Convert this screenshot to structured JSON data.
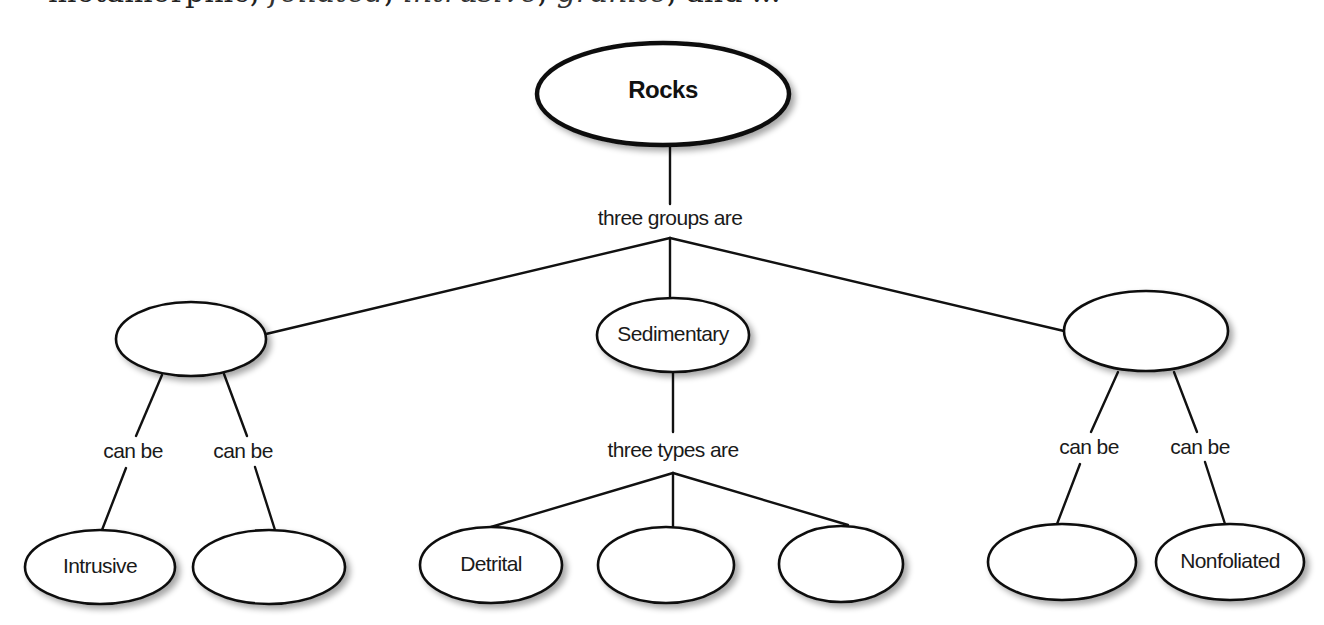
{
  "header": {
    "partial_text_start": "metamorphic, ",
    "partial_text_italic_1": "foliated",
    "partial_text_mid": ", ",
    "partial_text_italic_2": "intrusive",
    "partial_text_mid2": ", ",
    "partial_text_italic_3": "granite",
    "partial_text_end": ", and ..."
  },
  "diagram": {
    "root": {
      "label": "Rocks"
    },
    "root_link": "three groups are",
    "groups": [
      {
        "label": "",
        "links": [
          "can be",
          "can be"
        ],
        "children": [
          {
            "label": "Intrusive"
          },
          {
            "label": ""
          }
        ]
      },
      {
        "label": "Sedimentary",
        "link": "three types are",
        "children": [
          {
            "label": "Detrital"
          },
          {
            "label": ""
          },
          {
            "label": ""
          }
        ]
      },
      {
        "label": "",
        "links": [
          "can be",
          "can be"
        ],
        "children": [
          {
            "label": ""
          },
          {
            "label": "Nonfoliated"
          }
        ]
      }
    ]
  },
  "colors": {
    "stroke": "#111111",
    "background": "#ffffff",
    "text": "#1a1a1a"
  }
}
